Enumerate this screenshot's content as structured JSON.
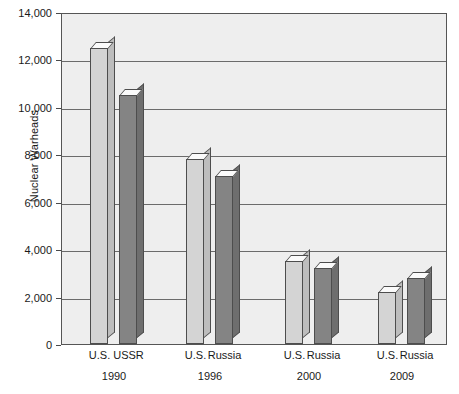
{
  "chart_data": {
    "type": "bar",
    "title": "",
    "subtitle": "",
    "xlabel": "",
    "ylabel": "Nuclear Warheads",
    "ylim": [
      0,
      14000
    ],
    "ytick_values": [
      0,
      2000,
      4000,
      6000,
      8000,
      10000,
      12000,
      14000
    ],
    "ytick_labels": [
      "0",
      "2,000",
      "4,000",
      "6,000",
      "8,000",
      "10,000",
      "12,000",
      "14,000"
    ],
    "grid": true,
    "legend": "none",
    "style": "3d-columns",
    "groups": [
      {
        "year": "1990",
        "bars": [
          {
            "label": "U.S.",
            "value": 12500,
            "shade": "light"
          },
          {
            "label": "USSR",
            "value": 10500,
            "shade": "dark"
          }
        ]
      },
      {
        "year": "1996",
        "bars": [
          {
            "label": "U.S.",
            "value": 7800,
            "shade": "light"
          },
          {
            "label": "Russia",
            "value": 7100,
            "shade": "dark"
          }
        ]
      },
      {
        "year": "2000",
        "bars": [
          {
            "label": "U.S.",
            "value": 3500,
            "shade": "light"
          },
          {
            "label": "Russia",
            "value": 3200,
            "shade": "dark"
          }
        ]
      },
      {
        "year": "2009",
        "bars": [
          {
            "label": "U.S.",
            "value": 2200,
            "shade": "light"
          },
          {
            "label": "Russia",
            "value": 2800,
            "shade": "dark"
          }
        ]
      }
    ],
    "colors": {
      "bar_light": "#d4d4d4",
      "bar_dark": "#848484",
      "plot_background": "#eeeeee",
      "gridline": "#6b6b6b",
      "axis": "#555555",
      "text": "#1a1a1a"
    }
  }
}
